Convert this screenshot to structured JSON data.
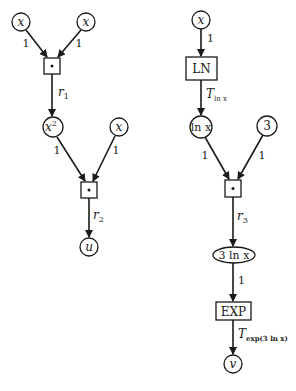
{
  "colors": {
    "ink": "#1a1a1a",
    "background": "#ffffff"
  },
  "left_graph": {
    "inputs": [
      "x",
      "x"
    ],
    "multiply_1": {
      "symbol": "•"
    },
    "result_1": {
      "base": "x",
      "exponent": "2"
    },
    "edge_r1": {
      "main": "r",
      "sub": "1"
    },
    "second_input": "x",
    "multiply_2": {
      "symbol": "•"
    },
    "edge_r2": {
      "main": "r",
      "sub": "2"
    },
    "output": "u",
    "weights": [
      "1",
      "1",
      "1",
      "1"
    ]
  },
  "right_graph": {
    "input": "x",
    "ln_box": "LN",
    "edge_t_ln": {
      "main": "T",
      "sub": "ln x"
    },
    "ln_node": "ln x",
    "const_node": "3",
    "multiply": {
      "symbol": "•"
    },
    "edge_r3": {
      "main": "r",
      "sub": "3"
    },
    "product_node": "3 ln x",
    "exp_box": "EXP",
    "edge_t_exp": {
      "main": "T",
      "sub": "exp(3 ln x)"
    },
    "output": "v",
    "weights": [
      "1",
      "1",
      "1",
      "1"
    ]
  }
}
